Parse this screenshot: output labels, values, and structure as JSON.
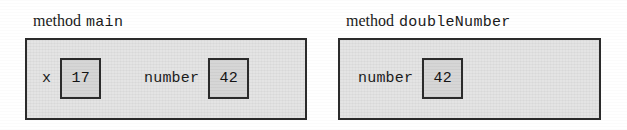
{
  "figure": {
    "keyword": "method",
    "frames": [
      {
        "caption_keyword": "method",
        "caption_name": "main",
        "variables": [
          {
            "name": "x",
            "value": "17"
          },
          {
            "name": "number",
            "value": "42"
          }
        ]
      },
      {
        "caption_keyword": "method",
        "caption_name": "doubleNumber",
        "variables": [
          {
            "name": "number",
            "value": "42"
          }
        ]
      }
    ]
  },
  "colors": {
    "frame_border": "#2b2b2b",
    "frame_fill": "#e4e4e4",
    "box_border": "#2b2b2b",
    "box_fill": "#d6d6d6",
    "text": "#1a1a1a",
    "page_background": "#ffffff"
  }
}
